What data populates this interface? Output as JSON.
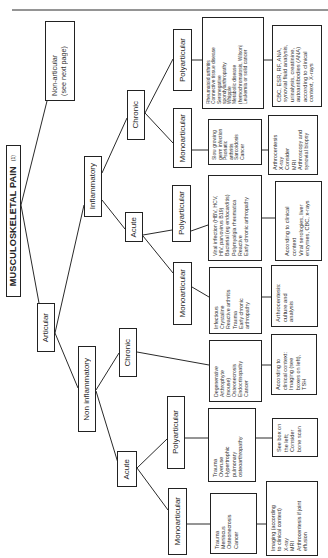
{
  "title": {
    "main": "MUSCULOSKELETAL PAIN",
    "page_ref": "(1)"
  },
  "nodes": {
    "non_articular": [
      "Non-articular",
      "(see next page)"
    ],
    "articular": "Articular",
    "inflammatory": "Inflammatory",
    "non_inflammatory": "Non inflammatory",
    "infl_chronic": "Chronic",
    "infl_acute": "Acute",
    "noninfl_chronic": "Chronic",
    "noninfl_acute": "Acute",
    "infl_chronic_poly": "Polyarticular",
    "infl_chronic_mono": "Monoarticular",
    "infl_acute_poly": "Polyarticular",
    "infl_acute_mono": "Monoarticular",
    "noninfl_acute_poly": "Polyarticular",
    "noninfl_acute_mono": "Monoarticular"
  },
  "causes": {
    "infl_chronic_poly": [
      "Rheumatoid arthritis",
      "Connective tissue disease",
      "Seronegative",
      "spondylarthropathy",
      "Whipple",
      "Metabolic disease",
      "(hemochromatosis, Wilson)",
      "Leukemia or solid cancer"
    ],
    "infl_chronic_mono": [
      "Slow growing",
      "germ infection",
      "Psoriatic",
      "arthritis",
      "Sarcoidosis",
      "Cancer"
    ],
    "infl_acute_poly": [
      "Viral infection (HBV, HCV,",
      "HIV, parvovirus B19)",
      "Bacterial (eg endocarditis)",
      "Polymyalgia rheumatica",
      "Reactive",
      "Early chronic arthropathy"
    ],
    "infl_acute_mono": [
      "Infectious",
      "Crystaline",
      "Reactive arthritis",
      "Trauma",
      "Early chronic",
      "arthropathy"
    ],
    "noninfl_chronic": [
      "Degenerative",
      "Arthrophyte",
      "(mouse)",
      "Osteonecrosis",
      "Endocrinopathy",
      "Cancer"
    ],
    "noninfl_acute_poly": [
      "Trauma",
      "Overuse",
      "Hypertrophic",
      "pulmonary",
      "osteoarthropathy"
    ],
    "noninfl_acute_mono": [
      "Trauma",
      "Meniscus",
      "Osteonecrosis",
      "Cancer"
    ]
  },
  "workup": {
    "infl_chronic_poly": [
      "CBC, ESR, RF, ANA,",
      "synovial fluid analysis,",
      "urinalysis, creatinine,",
      "autoantibodies (ANA)",
      "according to clinical",
      "context, X-rays"
    ],
    "infl_chronic_mono": [
      "Arthrocentesis",
      "X-ray",
      "Consider",
      "MRI",
      "Arthroscopy and",
      "synovial biopsy"
    ],
    "infl_acute_poly": [
      "According to clinical",
      "context",
      "Viral serologies, liver",
      "enzymes, CBC, x-rays"
    ],
    "infl_acute_mono": [
      "Arthrocentesis:",
      "culture and",
      "analysis"
    ],
    "noninfl_chronic": [
      "According to",
      "clinical context:",
      "Imaging (see",
      "boxes on left),",
      "TSH"
    ],
    "noninfl_acute_poly": [
      "See box on",
      "the left;",
      "Consider",
      "bone scan"
    ],
    "noninfl_acute_mono": [
      "Imaging (according",
      "to clinical context)",
      "X-ray",
      "MRI",
      "Arthrocentesis if joint",
      "effusion"
    ]
  }
}
